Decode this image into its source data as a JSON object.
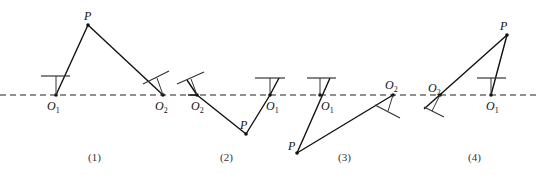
{
  "diagram": {
    "baseline": {
      "y": 95,
      "style": "dashed"
    },
    "figures": [
      {
        "caption": "(1)",
        "caption_x": 100,
        "points": {
          "P": {
            "label": "P",
            "x": 88,
            "y": 25
          },
          "O1": {
            "label": "O",
            "sub": "1",
            "x": 56,
            "y": 95
          },
          "O2": {
            "label": "O",
            "sub": "2",
            "x": 163,
            "y": 95
          }
        }
      },
      {
        "caption": "(2)",
        "caption_x": 230,
        "points": {
          "O2": {
            "label": "O",
            "sub": "2",
            "x": 197,
            "y": 95
          },
          "O1": {
            "label": "O",
            "sub": "1",
            "x": 270,
            "y": 95
          },
          "P": {
            "label": "P",
            "x": 246,
            "y": 134
          }
        }
      },
      {
        "caption": "(3)",
        "caption_x": 348,
        "points": {
          "O1": {
            "label": "O",
            "sub": "1",
            "x": 320,
            "y": 95
          },
          "O2": {
            "label": "O",
            "sub": "2",
            "x": 393,
            "y": 95
          },
          "P": {
            "label": "P",
            "x": 297,
            "y": 153
          }
        }
      },
      {
        "caption": "(4)",
        "caption_x": 478,
        "points": {
          "P": {
            "label": "P",
            "x": 507,
            "y": 35
          },
          "O1": {
            "label": "O",
            "sub": "1",
            "x": 491,
            "y": 95
          },
          "O2": {
            "label": "O",
            "sub": "2",
            "x": 440,
            "y": 97
          }
        }
      }
    ]
  }
}
